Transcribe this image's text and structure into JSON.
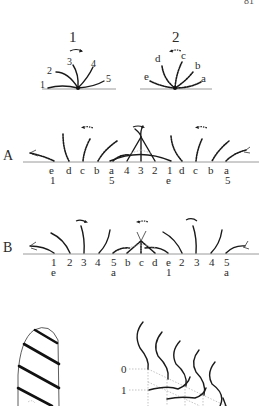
{
  "page": {
    "page_number_fragment": "81",
    "colors": {
      "ink": "#1a1a1a",
      "baseline": "#9a9a9a",
      "guide": "#aaaaaa",
      "background": "#ffffff"
    }
  },
  "figure": {
    "panel_1": {
      "title": "1",
      "stroke_style": "solid",
      "beat_direction": "right",
      "cilia_labels": [
        "1",
        "2",
        "3",
        "4",
        "5"
      ]
    },
    "panel_2": {
      "title": "2",
      "stroke_style": "dashed",
      "beat_direction": "left",
      "cilia_labels": [
        "e",
        "d",
        "c",
        "b",
        "a"
      ]
    },
    "row_A": {
      "label": "A",
      "top_labels": [
        "e",
        "d",
        "c",
        "b",
        "a",
        "4",
        "3",
        "2",
        "1",
        "d",
        "c",
        "b",
        "a"
      ],
      "bottom_labels": [
        "1",
        "5",
        "e",
        "5"
      ]
    },
    "row_B": {
      "label": "B",
      "top_labels": [
        "1",
        "2",
        "3",
        "4",
        "5",
        "b",
        "c",
        "d",
        "e",
        "2",
        "3",
        "4",
        "5"
      ],
      "bottom_labels": [
        "e",
        "a",
        "1",
        "a"
      ]
    },
    "bottom_left": {
      "description": "cylinder with diagonal stripes"
    },
    "bottom_right": {
      "axis_labels": [
        "0",
        "1"
      ]
    }
  }
}
